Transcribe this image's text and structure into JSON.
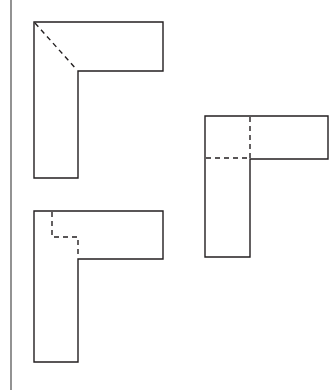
{
  "page": {
    "width": 334,
    "height": 390,
    "background_color": "#ffffff",
    "ink_color": "#231f20"
  },
  "margin_rule": {
    "name": "left-margin-rule",
    "color": "#3a3a3a",
    "x": 11,
    "y1": 0,
    "y2": 390,
    "width": 1.1
  },
  "figures": [
    {
      "id": "view-top-left",
      "label": "top-left L-view",
      "outline_points": "34,22 163,22 163,71 78,71 78,178 34,178",
      "hidden_lines": [
        {
          "name": "diagonal-hidden-edge",
          "type": "diagonal",
          "points": "35,23 77,70"
        }
      ]
    },
    {
      "id": "view-right",
      "label": "right L-view",
      "outline_points": "205,116 328,116 328,159 250,159 250,257 205,257",
      "hidden_lines": [
        {
          "name": "vertical-hidden-edge",
          "type": "vertical",
          "points": "250,117 250,158"
        },
        {
          "name": "horizontal-hidden-edge",
          "type": "horizontal",
          "points": "206,158 250,158"
        }
      ]
    },
    {
      "id": "view-bottom-left",
      "label": "bottom-left L-view",
      "outline_points": "34,211 163,211 163,259 78,259 78,362 34,362",
      "hidden_lines": [
        {
          "name": "stepped-hidden-edge",
          "type": "stepped",
          "points": "52,212 52,237 78,237 78,258"
        }
      ]
    }
  ],
  "stroke": {
    "outline_width": 1.4,
    "hidden_width": 1.4,
    "hidden_dash": "5 4"
  }
}
